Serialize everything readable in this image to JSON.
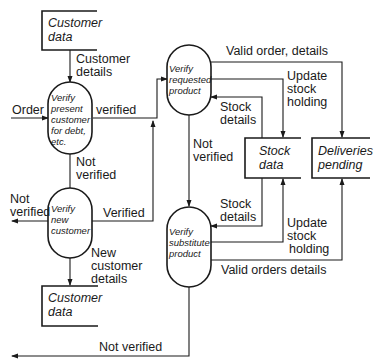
{
  "diagram": {
    "type": "data-flow-diagram",
    "processes": {
      "verify_present_customer": [
        "Verify",
        "present",
        "customer",
        "for debt,",
        "etc."
      ],
      "verify_new_customer": [
        "Verify",
        "new",
        "customer"
      ],
      "verify_requested_product": [
        "Verify",
        "requested",
        "product"
      ],
      "verify_substitute_product": [
        "Verify",
        "substitute",
        "product"
      ]
    },
    "stores": {
      "customer_data_top": [
        "Customer",
        "data"
      ],
      "customer_data_bottom": [
        "Customer",
        "data"
      ],
      "stock_data": [
        "Stock",
        "data"
      ],
      "deliveries_pending": [
        "Deliveries",
        "pending"
      ]
    },
    "flows": {
      "customer_details": [
        "Customer",
        "details"
      ],
      "order": "Order",
      "verified_top": "verified",
      "not_verified_left_mid": [
        "Not",
        "verified"
      ],
      "not_verified_new": [
        "Not",
        "verified"
      ],
      "verified_new": "Verified",
      "new_customer_details": [
        "New",
        "customer",
        "details"
      ],
      "valid_order_details": "Valid order, details",
      "update_stock_holding_top": [
        "Update",
        "stock",
        "holding"
      ],
      "stock_details_top": [
        "Stock",
        "details"
      ],
      "not_verified_product": [
        "Not",
        "verified"
      ],
      "stock_details_bottom": [
        "Stock",
        "details"
      ],
      "update_stock_holding_bottom": [
        "Update",
        "stock",
        "holding"
      ],
      "valid_orders_details": "Valid orders details",
      "not_verified_bottom": "Not verified"
    }
  }
}
